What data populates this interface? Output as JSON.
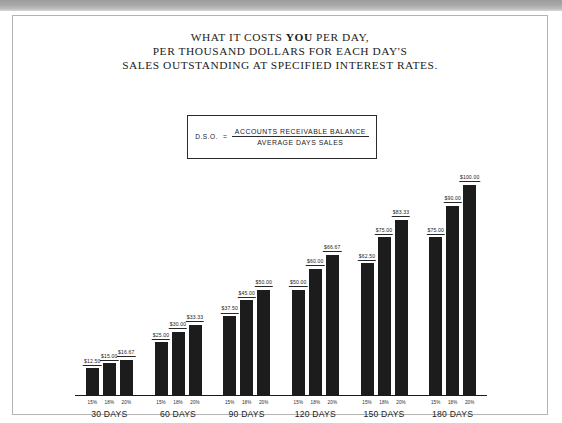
{
  "title": {
    "line1_prefix": "WHAT IT COSTS ",
    "line1_bold": "YOU",
    "line1_suffix": " PER DAY,",
    "line2": "PER THOUSAND DOLLARS FOR EACH DAY'S",
    "line3": "SALES OUTSTANDING AT SPECIFIED INTEREST RATES."
  },
  "formula": {
    "term": "D.S.O.",
    "equals": "=",
    "numerator": "ACCOUNTS RECEIVABLE BALANCE",
    "denominator": "AVERAGE DAYS SALES"
  },
  "chart_data": {
    "type": "bar",
    "title": "WHAT IT COSTS YOU PER DAY, PER THOUSAND DOLLARS FOR EACH DAY'S SALES OUTSTANDING AT SPECIFIED INTEREST RATES.",
    "xlabel": "",
    "ylabel": "",
    "ylim": [
      0,
      100
    ],
    "grid": false,
    "legend": "none",
    "categories": [
      "30 DAYS",
      "60 DAYS",
      "90 DAYS",
      "120 DAYS",
      "150 DAYS",
      "180 DAYS"
    ],
    "subcategories": [
      "15%",
      "18%",
      "20%"
    ],
    "series": [
      {
        "name": "15%",
        "values": [
          12.5,
          25.0,
          37.5,
          50.0,
          62.5,
          75.0
        ],
        "labels": [
          "$12.50",
          "$25.00",
          "$37.50",
          "$50.00",
          "$62.50",
          "$75.00"
        ]
      },
      {
        "name": "18%",
        "values": [
          15.0,
          30.0,
          45.0,
          60.0,
          75.0,
          90.0
        ],
        "labels": [
          "$15.00",
          "$30.00",
          "$45.00",
          "$60.00",
          "$75.00",
          "$90.00"
        ]
      },
      {
        "name": "20%",
        "values": [
          16.67,
          33.33,
          50.0,
          66.67,
          83.33,
          100.0
        ],
        "labels": [
          "$16.67",
          "$33.33",
          "$50.00",
          "$66.67",
          "$83.33",
          "$100.00"
        ]
      }
    ]
  }
}
